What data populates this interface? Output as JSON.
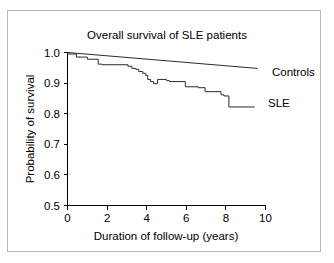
{
  "figure": {
    "border_color": "#b9b9b9",
    "background": "#ffffff"
  },
  "chart_data": {
    "type": "line",
    "title": "Overall survival of SLE patients",
    "xlabel": "Duration of follow-up (years)",
    "ylabel": "Probability of survival",
    "xlim": [
      0,
      10
    ],
    "ylim": [
      0.5,
      1.0
    ],
    "xticks": [
      0,
      2,
      4,
      6,
      8,
      10
    ],
    "xticklabels": [
      "0",
      "2",
      "4",
      "6",
      "8",
      "10"
    ],
    "yticks": [
      0.5,
      0.6,
      0.7,
      0.8,
      0.9,
      1.0
    ],
    "yticklabels": [
      "0.5",
      "0.6",
      "0.7",
      "0.8",
      "0.9",
      "1.0"
    ],
    "grid": false,
    "legend_position": "right-inline",
    "line_color": "#2b2b2b",
    "series": [
      {
        "name": "Controls",
        "style": "straight",
        "label": "Controls",
        "x": [
          0.0,
          9.6
        ],
        "values": [
          1.0,
          0.948
        ]
      },
      {
        "name": "SLE",
        "style": "step",
        "label": "SLE",
        "x": [
          0.0,
          0.45,
          0.45,
          1.0,
          1.0,
          1.55,
          1.55,
          1.75,
          1.75,
          3.05,
          3.05,
          3.25,
          3.25,
          3.45,
          3.45,
          3.6,
          3.6,
          3.8,
          3.8,
          3.95,
          3.95,
          4.05,
          4.05,
          4.2,
          4.2,
          4.35,
          4.35,
          4.55,
          4.55,
          5.0,
          5.0,
          5.15,
          5.15,
          5.95,
          5.95,
          6.6,
          6.6,
          6.95,
          6.95,
          7.75,
          7.75,
          7.9,
          7.9,
          8.15,
          8.15,
          9.45
        ],
        "values": [
          0.995,
          0.995,
          0.985,
          0.985,
          0.978,
          0.978,
          0.962,
          0.962,
          0.96,
          0.96,
          0.955,
          0.955,
          0.948,
          0.948,
          0.945,
          0.945,
          0.938,
          0.938,
          0.932,
          0.932,
          0.925,
          0.925,
          0.912,
          0.912,
          0.905,
          0.905,
          0.898,
          0.898,
          0.912,
          0.912,
          0.908,
          0.908,
          0.905,
          0.905,
          0.888,
          0.888,
          0.885,
          0.885,
          0.872,
          0.872,
          0.862,
          0.862,
          0.858,
          0.858,
          0.822,
          0.822
        ]
      }
    ]
  }
}
